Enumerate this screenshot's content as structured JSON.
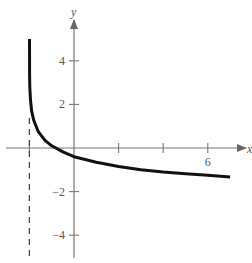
{
  "chart_data": {
    "type": "line",
    "title": "",
    "xlabel": "x",
    "ylabel": "y",
    "xlim": [
      -3.2,
      8
    ],
    "ylim": [
      -5,
      6
    ],
    "grid": false,
    "x_tick_labels": [
      {
        "value": 6,
        "label": "6"
      }
    ],
    "x_ticks": [
      -2,
      2,
      4,
      6
    ],
    "y_tick_labels": [
      {
        "value": 4,
        "label": "4"
      },
      {
        "value": 2,
        "label": "2"
      },
      {
        "value": -2,
        "label": "−2"
      },
      {
        "value": -4,
        "label": "−4"
      }
    ],
    "asymptote": {
      "type": "vertical",
      "x": -2,
      "style": "dashed"
    },
    "series": [
      {
        "name": "curve",
        "x": [
          -1.995,
          -1.99,
          -1.98,
          -1.95,
          -1.9,
          -1.8,
          -1.6,
          -1.3,
          -1.0,
          -0.5,
          0,
          1,
          2,
          3,
          4,
          5,
          6,
          7
        ],
        "y": [
          5.0,
          3.3,
          2.8,
          2.2,
          1.7,
          1.25,
          0.75,
          0.35,
          0.1,
          -0.18,
          -0.4,
          -0.65,
          -0.85,
          -1.0,
          -1.1,
          -1.18,
          -1.25,
          -1.33
        ]
      }
    ]
  }
}
